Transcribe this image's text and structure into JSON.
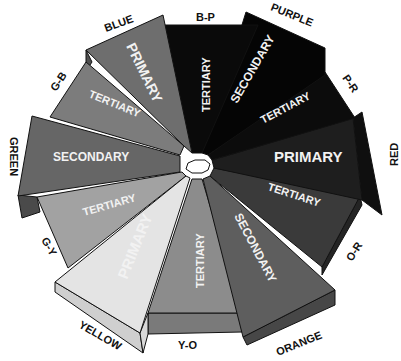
{
  "diagram": {
    "center": {
      "x": 196,
      "y": 167
    },
    "wedges": [
      {
        "id": "blue",
        "name": "BLUE",
        "type": "PRIMARY",
        "fill": "#6e6e6e",
        "side": "#4f4f4f"
      },
      {
        "id": "b-p",
        "name": "B-P",
        "type": "TERTIARY",
        "fill": "#0a0a0a",
        "side": "#000000"
      },
      {
        "id": "purple",
        "name": "PURPLE",
        "type": "SECONDARY",
        "fill": "#050505",
        "side": "#000000"
      },
      {
        "id": "p-r",
        "name": "P-R",
        "type": "TERTIARY",
        "fill": "#0c0c0c",
        "side": "#000000"
      },
      {
        "id": "red",
        "name": "RED",
        "type": "PRIMARY",
        "fill": "#1e1e1e",
        "side": "#0f0f0f"
      },
      {
        "id": "o-r",
        "name": "O-R",
        "type": "TERTIARY",
        "fill": "#3a3a3a",
        "side": "#242424"
      },
      {
        "id": "orange",
        "name": "ORANGE",
        "type": "SECONDARY",
        "fill": "#5e5e5e",
        "side": "#474747"
      },
      {
        "id": "y-o",
        "name": "Y-O",
        "type": "TERTIARY",
        "fill": "#8c8c8c",
        "side": "#7a7a7a"
      },
      {
        "id": "yellow",
        "name": "YELLOW",
        "type": "PRIMARY",
        "fill": "#e4e4e4",
        "side": "#cfcfcf"
      },
      {
        "id": "g-y",
        "name": "G-Y",
        "type": "TERTIARY",
        "fill": "#a2a2a2",
        "side": "#8a8a8a"
      },
      {
        "id": "green",
        "name": "GREEN",
        "type": "SECONDARY",
        "fill": "#666666",
        "side": "#4a4a4a"
      },
      {
        "id": "g-b",
        "name": "G-B",
        "type": "TERTIARY",
        "fill": "#7c7c7c",
        "side": "#5c5c5c"
      }
    ],
    "center_fill": "#ffffff",
    "outline_color": "#111111"
  }
}
